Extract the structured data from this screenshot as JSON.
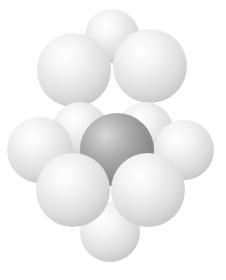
{
  "figure": {
    "colors": {
      "background": "#ffffff",
      "sphere_light": "#e2e2e2",
      "sphere_dark": "#8a8a8a"
    },
    "spheres": [
      {
        "id": "top-back",
        "cx": 112,
        "cy": 36,
        "r": 27,
        "shade": "light",
        "layer": "top"
      },
      {
        "id": "top-left",
        "cx": 74,
        "cy": 70,
        "r": 37,
        "shade": "light",
        "layer": "top"
      },
      {
        "id": "top-right",
        "cx": 150,
        "cy": 66,
        "r": 37,
        "shade": "light",
        "layer": "top"
      },
      {
        "id": "bottom-back-left",
        "cx": 80,
        "cy": 130,
        "r": 28,
        "shade": "light",
        "layer": "bottom"
      },
      {
        "id": "bottom-back-right",
        "cx": 145,
        "cy": 130,
        "r": 28,
        "shade": "light",
        "layer": "bottom"
      },
      {
        "id": "bottom-far-left",
        "cx": 40,
        "cy": 150,
        "r": 33,
        "shade": "light",
        "layer": "bottom"
      },
      {
        "id": "bottom-far-right",
        "cx": 184,
        "cy": 150,
        "r": 30,
        "shade": "light",
        "layer": "bottom"
      },
      {
        "id": "bottom-center",
        "cx": 117,
        "cy": 150,
        "r": 37,
        "shade": "dark",
        "layer": "bottom"
      },
      {
        "id": "bottom-bottom",
        "cx": 110,
        "cy": 232,
        "r": 30,
        "shade": "light",
        "layer": "bottom"
      },
      {
        "id": "bottom-front-left",
        "cx": 73,
        "cy": 190,
        "r": 37,
        "shade": "light",
        "layer": "bottom"
      },
      {
        "id": "bottom-front-right",
        "cx": 148,
        "cy": 190,
        "r": 37,
        "shade": "light",
        "layer": "bottom"
      }
    ]
  }
}
